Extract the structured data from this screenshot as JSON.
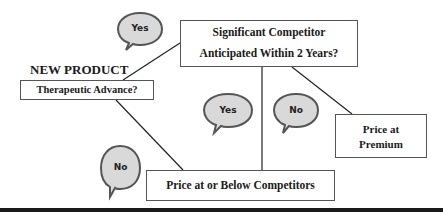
{
  "diagram": {
    "heading": "NEW PRODUCT",
    "nodes": {
      "therapeutic_advance": "Therapeutic Advance?",
      "competitor_line1": "Significant Competitor",
      "competitor_line2": "Anticipated Within 2 Years?",
      "premium_line1": "Price at",
      "premium_line2": "Premium",
      "below_competitors": "Price at or Below Competitors"
    },
    "bubbles": [
      {
        "label": "Yes",
        "edge": "therapeutic_advance -> competitor"
      },
      {
        "label": "Yes",
        "edge": "competitor -> below_competitors"
      },
      {
        "label": "No",
        "edge": "competitor -> premium"
      },
      {
        "label": "No",
        "edge": "therapeutic_advance -> below_competitors"
      }
    ],
    "colors": {
      "bubble_fill": "#d9d9d9",
      "bubble_stroke": "#555555",
      "box_border": "#555555",
      "line": "#222222",
      "rule": "#1a1a1a"
    }
  }
}
